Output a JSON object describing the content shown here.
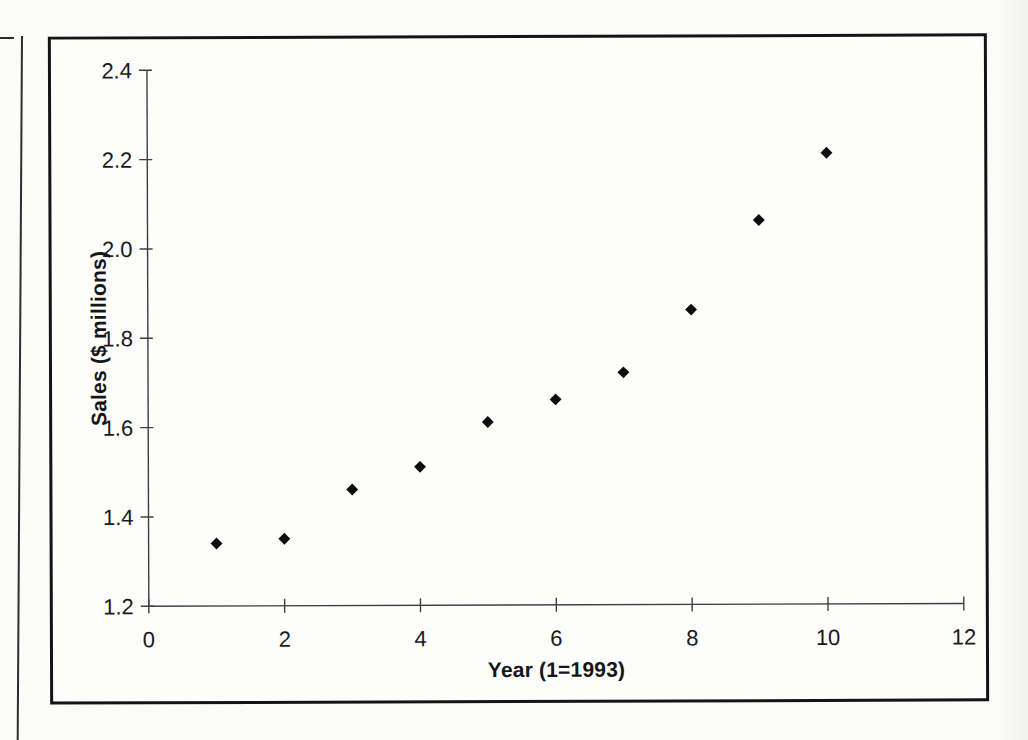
{
  "chart_data": {
    "type": "scatter",
    "title": "",
    "xlabel": "Year (1=1993)",
    "ylabel": "Sales ($ millions)",
    "x": [
      1,
      2,
      3,
      4,
      5,
      6,
      7,
      8,
      9,
      10
    ],
    "y": [
      1.34,
      1.35,
      1.46,
      1.51,
      1.61,
      1.66,
      1.72,
      1.86,
      2.06,
      2.21
    ],
    "xlim": [
      0,
      12
    ],
    "ylim": [
      1.2,
      2.4
    ],
    "xticks": [
      0,
      2,
      4,
      6,
      8,
      10,
      12
    ],
    "xtick_labels": [
      "0",
      "2",
      "4",
      "6",
      "8",
      "10",
      "12"
    ],
    "yticks": [
      2.4,
      2.2,
      2.0,
      1.8,
      1.6,
      1.4,
      1.2
    ],
    "ytick_labels": [
      "2.4",
      "2.2",
      "2.0",
      "1.8",
      "1.6",
      "1.4",
      "1.2"
    ],
    "grid": false,
    "legend": null,
    "marker": "diamond",
    "colors": {
      "marker": "#0d0d0d",
      "axis": "#3f3f3f",
      "text": "#1a1a1a",
      "frame": "#141414",
      "paper": "#fbfbf9"
    }
  }
}
